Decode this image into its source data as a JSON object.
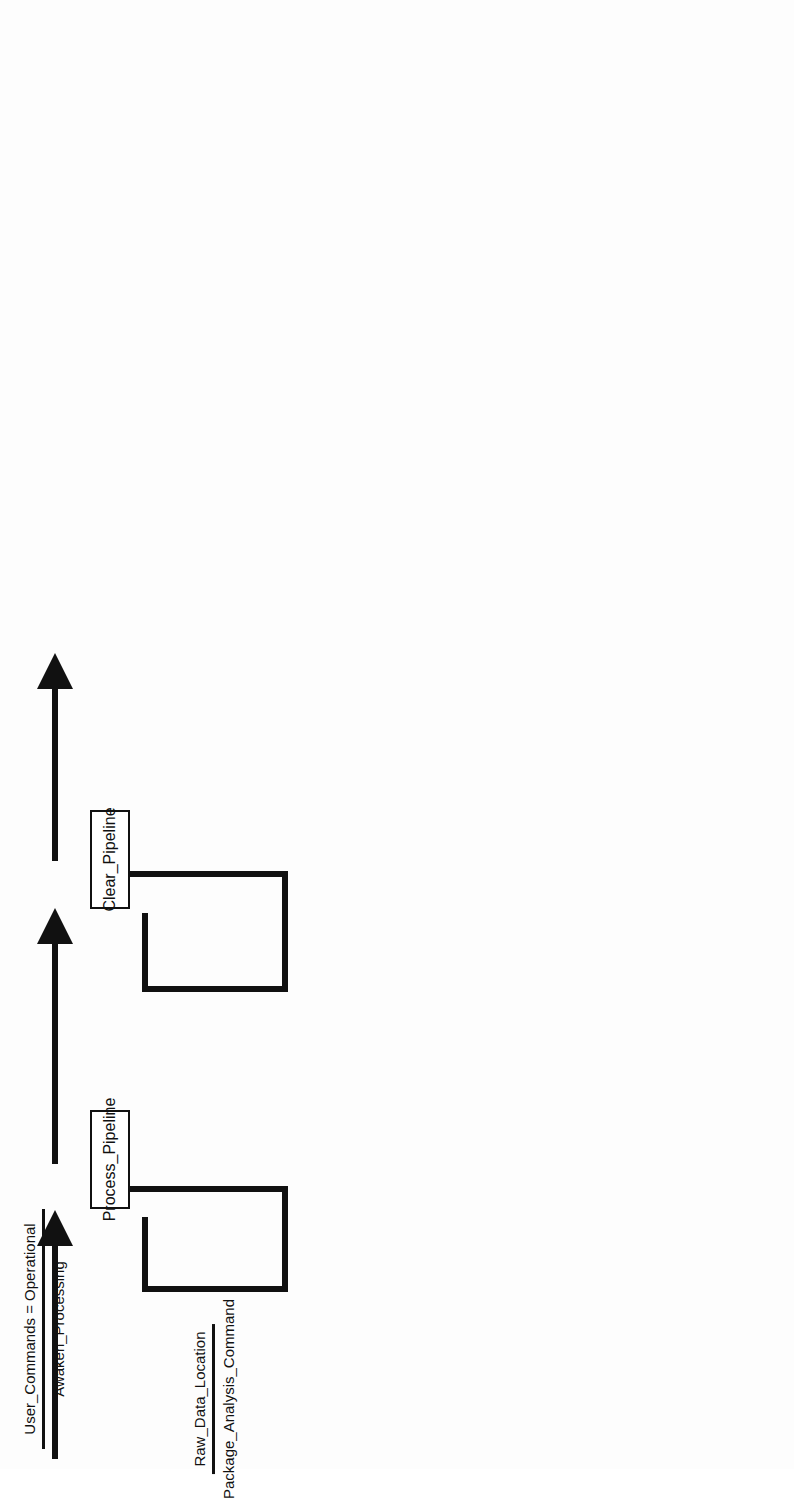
{
  "diagram": {
    "processes": [
      {
        "id": "process-pipeline",
        "label": "Process_Pipeline"
      },
      {
        "id": "clear-pipeline",
        "label": "Clear_Pipeline"
      }
    ],
    "transitions": [
      {
        "id": "t-awaken",
        "condition": "User_Commands = Operational",
        "action": "Awaken_Processing"
      },
      {
        "id": "t-pv-process",
        "condition": "Position_Velocity_Data",
        "action": "Package_Actuator_Command"
      },
      {
        "id": "t-raw-process",
        "condition": "Raw_Data_Location",
        "action": "Package_Analysis_Command"
      },
      {
        "id": "t-standby",
        "condition": "User_Commands_Standby",
        "action": "Record_Mode_Request"
      },
      {
        "id": "t-pv-clear",
        "condition": "Position_Velocity_Data and not Last Scan",
        "action": "Update_Records"
      },
      {
        "id": "t-raw-clear",
        "condition": "Raw_Data_Location",
        "action": "Update_Records"
      },
      {
        "id": "t-exit",
        "condition": "Position_Velocity_Data and Last Scan",
        "action": "Package_Display_Update_Commands,",
        "action2": "Suspend_Processing"
      }
    ],
    "table": {
      "actions_header": "Actions",
      "activate_header": "Activate Processes",
      "process_ids": [
        "5.1",
        "5.2",
        "5.3"
      ],
      "rows": [
        {
          "action": "Package_ Analysis_ Command",
          "v": [
            "1",
            "",
            ""
          ]
        },
        {
          "action": "Package_ Actuator_ Command",
          "v": [
            "",
            "1",
            ""
          ]
        },
        {
          "action": "Package_Display_Update_Commands",
          "v": [
            "",
            "",
            "1"
          ]
        }
      ]
    }
  }
}
